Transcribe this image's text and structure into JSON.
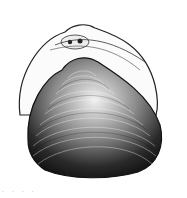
{
  "figure": {
    "ink_color": "#1a1a1a",
    "paper_color": "#ffffff"
  },
  "caption": {
    "text": ". . . ."
  }
}
